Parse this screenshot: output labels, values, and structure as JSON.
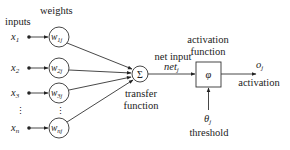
{
  "diagram": {
    "title": "",
    "labels": {
      "inputs": "inputs",
      "weights": "weights",
      "net_input": "net input",
      "net_symbol": "net",
      "net_sub": "j",
      "activation_function_line1": "activation",
      "activation_function_line2": "function",
      "transfer_function_line1": "transfer",
      "transfer_function_line2": "function",
      "output_symbol": "o",
      "output_sub": "j",
      "output_label": "activation",
      "threshold_symbol": "θ",
      "threshold_sub": "j",
      "threshold_label": "threshold",
      "sum_symbol": "Σ",
      "activation_symbol": "φ",
      "ellipsis": "⋮"
    },
    "inputs": [
      {
        "symbol": "x",
        "sub": "1"
      },
      {
        "symbol": "x",
        "sub": "2"
      },
      {
        "symbol": "x",
        "sub": "3"
      },
      {
        "symbol": "x",
        "sub": "n"
      }
    ],
    "weights": [
      {
        "symbol": "w",
        "sub": "1j"
      },
      {
        "symbol": "w",
        "sub": "2j"
      },
      {
        "symbol": "w",
        "sub": "3j"
      },
      {
        "symbol": "w",
        "sub": "nj"
      }
    ],
    "colors": {
      "line": "#333333",
      "text": "#222222",
      "background": "#ffffff"
    }
  }
}
